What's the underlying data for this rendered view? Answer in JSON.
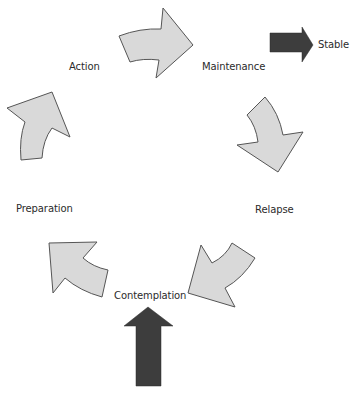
{
  "diagram": {
    "type": "cycle",
    "stages": [
      {
        "id": "contemplation",
        "label": "Contemplation"
      },
      {
        "id": "preparation",
        "label": "Preparation"
      },
      {
        "id": "action",
        "label": "Action"
      },
      {
        "id": "maintenance",
        "label": "Maintenance"
      },
      {
        "id": "relapse",
        "label": "Relapse"
      }
    ],
    "exit": {
      "label": "Stable"
    },
    "arrows": [
      {
        "from": "contemplation",
        "to": "preparation",
        "style": "curved-light"
      },
      {
        "from": "preparation",
        "to": "action",
        "style": "curved-light"
      },
      {
        "from": "action",
        "to": "maintenance",
        "style": "curved-light"
      },
      {
        "from": "maintenance",
        "to": "relapse",
        "style": "curved-light"
      },
      {
        "from": "relapse",
        "to": "contemplation",
        "style": "curved-light"
      },
      {
        "from": "entry",
        "to": "contemplation",
        "style": "straight-dark"
      },
      {
        "from": "maintenance",
        "to": "stable",
        "style": "straight-dark"
      }
    ]
  },
  "colors": {
    "cycle_arrow_fill": "#d9d9d9",
    "cycle_arrow_stroke": "#555555",
    "dark_arrow_fill": "#3d3d3d",
    "text": "#2b2b2b",
    "background": "#ffffff"
  }
}
